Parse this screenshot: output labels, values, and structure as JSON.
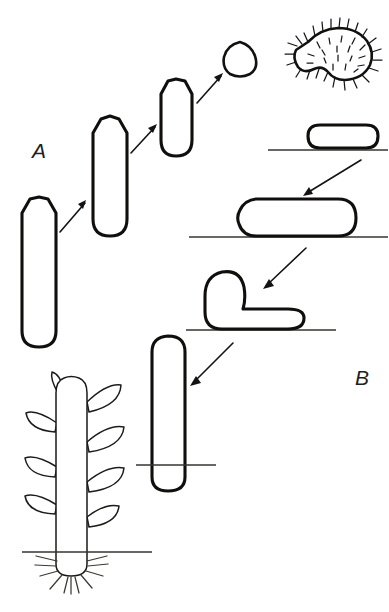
{
  "figure": {
    "background_color": "#ffffff",
    "ink_color": "#100f0d",
    "width": 389,
    "height": 612
  },
  "labels": {
    "panel_a": "A",
    "panel_b": "B"
  },
  "panels": [
    {
      "id": "A",
      "label": "A",
      "label_x": 32,
      "label_y": 158,
      "direction": "lower-left to upper-right",
      "description": "Progressive shortening of an erect cylindrical organ ending in a rounded seed body",
      "stage_count": 5
    },
    {
      "id": "B",
      "label": "B",
      "label_x": 355,
      "label_y": 385,
      "direction": "upper-right to lower-left",
      "description": "Horizontal seed on soil elongates, forms a hypocotyl hook, emerges erect, then develops into a leafy plant",
      "stage_count": 5
    }
  ],
  "stages_a": [
    {
      "name": "erect-rod-stage-1",
      "shape": "tall-capsule-pointed-apex",
      "x": 22,
      "y": 197,
      "width": 34,
      "height": 151,
      "apex": "pointed-rounded"
    },
    {
      "name": "erect-rod-stage-2",
      "shape": "capsule-pointed-apex",
      "x": 93,
      "y": 116,
      "width": 34,
      "height": 120,
      "apex": "pointed-rounded"
    },
    {
      "name": "erect-rod-stage-3",
      "shape": "capsule-pointed-apex",
      "x": 161,
      "y": 79,
      "width": 31,
      "height": 77,
      "apex": "pointed-rounded"
    },
    {
      "name": "seed-body-stage-4",
      "shape": "rounded-triangle",
      "x": 224,
      "y": 42,
      "width": 33,
      "height": 33,
      "apex": "rounded"
    },
    {
      "name": "hairy-seed-stage-5",
      "shape": "kidney-bean-with-bristles",
      "x": 296,
      "y": 28,
      "width": 78,
      "height": 52,
      "surface": "densely hairy"
    }
  ],
  "stages_b": [
    {
      "name": "seed-on-soil",
      "shape": "short-horizontal-capsule",
      "x": 308,
      "y": 125,
      "width": 70,
      "height": 23,
      "ground_y": 150
    },
    {
      "name": "elongating-axis",
      "shape": "long-horizontal-capsule-pointed-left",
      "x": 238,
      "y": 199,
      "width": 118,
      "height": 38,
      "ground_y": 237
    },
    {
      "name": "hypocotyl-hook",
      "shape": "j-hook",
      "x": 199,
      "y": 270,
      "width": 105,
      "height": 60,
      "ground_y": 330
    },
    {
      "name": "erect-seedling",
      "shape": "vertical-capsule-through-soil",
      "x": 152,
      "y": 336,
      "width": 33,
      "height": 155,
      "ground_y": 465
    },
    {
      "name": "leafy-plant",
      "shape": "stem-with-alternate-leaves-and-root-hairs",
      "x": 56,
      "y": 378,
      "width": 31,
      "height": 195,
      "ground_y": 552,
      "leaf_count": 8,
      "root_hair_count": 11
    }
  ],
  "arrows": [
    {
      "name": "arrow-a1-to-a2",
      "from": "erect-rod-stage-1",
      "to": "erect-rod-stage-2",
      "x1": 60,
      "y1": 231,
      "x2": 86,
      "y2": 201,
      "direction": "up-right"
    },
    {
      "name": "arrow-a2-to-a3",
      "from": "erect-rod-stage-2",
      "to": "erect-rod-stage-3",
      "x1": 131,
      "y1": 152,
      "x2": 156,
      "y2": 125,
      "direction": "up-right"
    },
    {
      "name": "arrow-a3-to-a4",
      "from": "erect-rod-stage-3",
      "to": "seed-body-stage-4",
      "x1": 198,
      "y1": 102,
      "x2": 222,
      "y2": 74,
      "direction": "up-right"
    },
    {
      "name": "arrow-b1-to-b2",
      "from": "seed-on-soil",
      "to": "elongating-axis",
      "x1": 360,
      "y1": 162,
      "x2": 304,
      "y2": 196,
      "direction": "down-left"
    },
    {
      "name": "arrow-b2-to-b3",
      "from": "elongating-axis",
      "to": "hypocotyl-hook",
      "x1": 305,
      "y1": 250,
      "x2": 264,
      "y2": 288,
      "direction": "down-left"
    },
    {
      "name": "arrow-b3-to-b4",
      "from": "hypocotyl-hook",
      "to": "erect-seedling",
      "x1": 232,
      "y1": 345,
      "x2": 191,
      "y2": 385,
      "direction": "down-left"
    }
  ],
  "ground_lines": [
    {
      "name": "ground-line-seed-on-soil",
      "x1": 268,
      "x2": 388,
      "y": 150
    },
    {
      "name": "ground-line-elongating-axis",
      "x1": 189,
      "x2": 388,
      "y": 237
    },
    {
      "name": "ground-line-hypocotyl-hook",
      "x1": 186,
      "x2": 336,
      "y": 330
    },
    {
      "name": "ground-line-erect-seedling",
      "x1": 136,
      "x2": 216,
      "y": 465
    },
    {
      "name": "ground-line-leafy-plant",
      "x1": 22,
      "x2": 152,
      "y": 552
    }
  ]
}
